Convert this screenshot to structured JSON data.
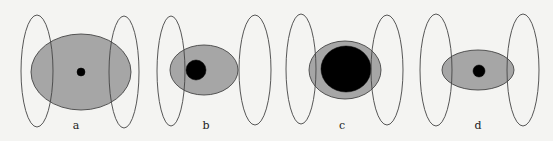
{
  "colors": {
    "background": "#f4f4f2",
    "outline": "#444444",
    "gray_fill": "#a6a6a6",
    "core_fill": "#000000"
  },
  "panels": [
    {
      "label": "a",
      "left_ring": {
        "cx": 37,
        "cy": 71,
        "rx": 16,
        "ry": 56
      },
      "middle": {
        "cx": 81,
        "cy": 72,
        "rx": 50,
        "ry": 38
      },
      "core": {
        "cx": 81,
        "cy": 72,
        "rx": 4,
        "ry": 4
      },
      "right_ring": {
        "cx": 124,
        "cy": 72,
        "rx": 15,
        "ry": 56
      },
      "label_pos": {
        "x": 76,
        "y": 129
      }
    },
    {
      "label": "b",
      "left_ring": {
        "cx": 171,
        "cy": 71,
        "rx": 14,
        "ry": 55
      },
      "middle": {
        "cx": 204,
        "cy": 70,
        "rx": 34,
        "ry": 25
      },
      "core": {
        "cx": 196,
        "cy": 70,
        "rx": 10,
        "ry": 10
      },
      "right_ring": {
        "cx": 255,
        "cy": 70,
        "rx": 16,
        "ry": 55
      },
      "label_pos": {
        "x": 206,
        "y": 129
      }
    },
    {
      "label": "c",
      "left_ring": {
        "cx": 301,
        "cy": 69,
        "rx": 15,
        "ry": 55
      },
      "middle": {
        "cx": 345,
        "cy": 70,
        "rx": 36,
        "ry": 29
      },
      "core": {
        "cx": 346,
        "cy": 69,
        "rx": 25,
        "ry": 23
      },
      "right_ring": {
        "cx": 387,
        "cy": 70,
        "rx": 16,
        "ry": 55
      },
      "label_pos": {
        "x": 342,
        "y": 129
      }
    },
    {
      "label": "d",
      "left_ring": {
        "cx": 436,
        "cy": 70,
        "rx": 16,
        "ry": 56
      },
      "middle": {
        "cx": 478,
        "cy": 70,
        "rx": 36,
        "ry": 20
      },
      "core": {
        "cx": 479,
        "cy": 71,
        "rx": 6,
        "ry": 6
      },
      "right_ring": {
        "cx": 523,
        "cy": 70,
        "rx": 16,
        "ry": 56
      },
      "label_pos": {
        "x": 478,
        "y": 129
      }
    }
  ]
}
